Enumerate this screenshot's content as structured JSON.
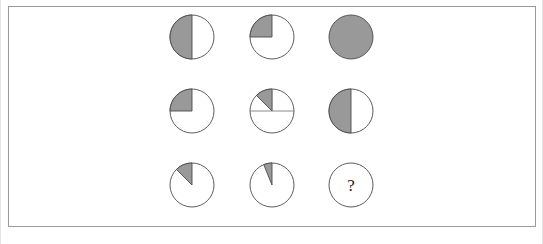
{
  "page": {
    "background_color": "#ffffff",
    "width": 543,
    "height": 244
  },
  "frame": {
    "name": "puzzle-frame",
    "border_color": "#9a9a9a",
    "fill_color": "#ffffff",
    "x": 8,
    "y": 6,
    "width": 528,
    "height": 221
  },
  "style": {
    "shaded_color": "#999999",
    "unshaded_color": "#ffffff",
    "stroke_color": "#4a4a4a",
    "guide_line_color": "#808080",
    "question_text_color": "#1a1a1a"
  },
  "geometry": {
    "radius": 22,
    "column_centers_x": [
      191,
      271,
      350
    ],
    "row_centers_y": [
      36,
      110,
      184
    ]
  },
  "chart_data": {
    "type": "pie",
    "subtitle": "3 x 3 matrix of shaded circles with one missing cell",
    "xlabel": "",
    "ylabel": "",
    "legend": [],
    "grid": false,
    "rows": 3,
    "columns": 3,
    "units": "degrees",
    "full_circle_degrees": 360,
    "shaded_color": "#999999",
    "unshaded_color": "#ffffff",
    "cells": [
      {
        "id": "r1c1",
        "row": 1,
        "column": 1,
        "label": "half-filled circle",
        "shaded_degrees": 180,
        "fraction": 0.5,
        "fraction_text": "1/2",
        "start_angle_deg": 270,
        "sweep_deg": 180,
        "sweep_direction": "counterclockwise",
        "is_full": false,
        "is_empty": false,
        "is_missing": false,
        "has_horizontal_guide": false,
        "has_vertical_guide": false,
        "center_x": 191,
        "center_y": 36
      },
      {
        "id": "r1c2",
        "row": 1,
        "column": 2,
        "label": "quarter-filled circle",
        "shaded_degrees": 90,
        "fraction": 0.25,
        "fraction_text": "1/4",
        "start_angle_deg": 270,
        "sweep_deg": 90,
        "sweep_direction": "counterclockwise",
        "is_full": false,
        "is_empty": false,
        "is_missing": false,
        "has_horizontal_guide": false,
        "has_vertical_guide": false,
        "center_x": 271,
        "center_y": 36
      },
      {
        "id": "r1c3",
        "row": 1,
        "column": 3,
        "label": "fully-filled circle",
        "shaded_degrees": 360,
        "fraction": 1.0,
        "fraction_text": "1/1",
        "start_angle_deg": 0,
        "sweep_deg": 360,
        "sweep_direction": "counterclockwise",
        "is_full": true,
        "is_empty": false,
        "is_missing": false,
        "has_horizontal_guide": false,
        "has_vertical_guide": false,
        "center_x": 350,
        "center_y": 36
      },
      {
        "id": "r2c1",
        "row": 2,
        "column": 1,
        "label": "quarter-filled circle",
        "shaded_degrees": 90,
        "fraction": 0.25,
        "fraction_text": "1/4",
        "start_angle_deg": 270,
        "sweep_deg": 90,
        "sweep_direction": "counterclockwise",
        "is_full": false,
        "is_empty": false,
        "is_missing": false,
        "has_horizontal_guide": false,
        "has_vertical_guide": false,
        "center_x": 191,
        "center_y": 110
      },
      {
        "id": "r2c2",
        "row": 2,
        "column": 2,
        "label": "eighth-filled circle with guide lines",
        "shaded_degrees": 45,
        "fraction": 0.125,
        "fraction_text": "1/8",
        "start_angle_deg": 270,
        "sweep_deg": 45,
        "sweep_direction": "counterclockwise",
        "is_full": false,
        "is_empty": false,
        "is_missing": false,
        "has_horizontal_guide": true,
        "has_vertical_guide": true,
        "center_x": 271,
        "center_y": 110
      },
      {
        "id": "r2c3",
        "row": 2,
        "column": 3,
        "label": "half-filled circle",
        "shaded_degrees": 180,
        "fraction": 0.5,
        "fraction_text": "1/2",
        "start_angle_deg": 270,
        "sweep_deg": 180,
        "sweep_direction": "counterclockwise",
        "is_full": false,
        "is_empty": false,
        "is_missing": false,
        "has_horizontal_guide": false,
        "has_vertical_guide": false,
        "center_x": 350,
        "center_y": 110
      },
      {
        "id": "r3c1",
        "row": 3,
        "column": 1,
        "label": "eighth-filled circle",
        "shaded_degrees": 45,
        "fraction": 0.125,
        "fraction_text": "1/8",
        "start_angle_deg": 270,
        "sweep_deg": 45,
        "sweep_direction": "counterclockwise",
        "is_full": false,
        "is_empty": false,
        "is_missing": false,
        "has_horizontal_guide": false,
        "has_vertical_guide": false,
        "center_x": 191,
        "center_y": 184
      },
      {
        "id": "r3c2",
        "row": 3,
        "column": 2,
        "label": "sixteenth-filled circle",
        "shaded_degrees": 22,
        "fraction": 0.0625,
        "fraction_text": "1/16",
        "start_angle_deg": 270,
        "sweep_deg": 22,
        "sweep_direction": "counterclockwise",
        "is_full": false,
        "is_empty": false,
        "is_missing": false,
        "has_horizontal_guide": false,
        "has_vertical_guide": false,
        "center_x": 271,
        "center_y": 184
      },
      {
        "id": "r3c3",
        "row": 3,
        "column": 3,
        "label": "missing cell",
        "shaded_degrees": 0,
        "fraction": 0,
        "fraction_text": "?",
        "start_angle_deg": 270,
        "sweep_deg": 0,
        "sweep_direction": "counterclockwise",
        "is_full": false,
        "is_empty": true,
        "is_missing": true,
        "has_horizontal_guide": false,
        "has_vertical_guide": false,
        "question_mark": "?",
        "center_x": 350,
        "center_y": 184
      }
    ]
  }
}
